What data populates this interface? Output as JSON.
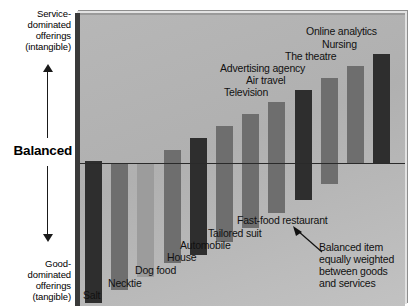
{
  "axis": {
    "top_label": "Service-\ndominated\nofferings\n(intangible)",
    "top_label_lines": [
      "Service-",
      "dominated",
      "offerings",
      "(intangible)"
    ],
    "center_label": "Balanced",
    "bottom_label_lines": [
      "Good-",
      "dominated",
      "offerings",
      "(tangible)"
    ],
    "up_arrow_icon": "arrow-up-icon",
    "down_arrow_icon": "arrow-down-icon"
  },
  "annotation": {
    "lines": [
      "Balanced item",
      "equally weighted",
      "between goods",
      "and services"
    ],
    "pointer_icon": "callout-arrow-icon"
  },
  "chart_data": {
    "type": "bar",
    "title": "",
    "subtitle": "",
    "xlabel": "",
    "ylabel": "Balanced",
    "grid": false,
    "legend": "none",
    "baseline": 0,
    "ylim": [
      -100,
      100
    ],
    "axis_top_text": "Service-dominated offerings (intangible)",
    "axis_bottom_text": "Good-dominated offerings (tangible)",
    "axis_center_text": "Balanced",
    "annotation_text": "Balanced item equally weighted between goods and services",
    "categories": [
      "Salt",
      "Necktie",
      "Dog food",
      "House",
      "Automobile",
      "Tailored suit",
      "Television",
      "Air travel",
      "Advertising agency",
      "The theatre",
      "Nursing",
      "Online analytics"
    ],
    "values": [
      -92,
      -82,
      -72,
      -56,
      -48,
      -34,
      -20,
      -8,
      0,
      12,
      30,
      46
    ],
    "series": [
      {
        "name": "Goods-services continuum",
        "values": [
          -92,
          -82,
          -72,
          -56,
          -48,
          -34,
          -20,
          -8,
          0,
          12,
          30,
          46
        ]
      }
    ],
    "bars": [
      {
        "label": "Salt",
        "top": -2,
        "bottom": 140,
        "shade": "dark"
      },
      {
        "label": "Necktie",
        "top": 0,
        "bottom": 127,
        "shade": "mid"
      },
      {
        "label": "Dog food",
        "top": 0,
        "bottom": 114,
        "shade": "light"
      },
      {
        "label": "House",
        "top": -13,
        "bottom": 100,
        "shade": "mid"
      },
      {
        "label": "Automobile",
        "top": -25,
        "bottom": 92,
        "shade": "dark"
      },
      {
        "label": "Tailored suit",
        "top": -37,
        "bottom": 79,
        "shade": "mid"
      },
      {
        "label": "Television",
        "top": -49,
        "bottom": 65,
        "shade": "mid"
      },
      {
        "label": "Air travel",
        "top": -61,
        "bottom": 50,
        "shade": "mid"
      },
      {
        "label": "Advertising agency",
        "top": -73,
        "bottom": 37,
        "shade": "dark"
      },
      {
        "label": "The theatre",
        "top": -85,
        "bottom": 21,
        "shade": "mid"
      },
      {
        "label": "Nursing",
        "top": -97,
        "bottom": 0,
        "shade": "mid"
      },
      {
        "label": "Online analytics",
        "top": -109,
        "bottom": 0,
        "shade": "dark"
      }
    ]
  },
  "labels": {
    "salt": "Salt",
    "necktie": "Necktie",
    "dog_food": "Dog food",
    "house": "House",
    "automobile": "Automobile",
    "tailored_suit": "Tailored suit",
    "fast_food": "Fast-food restaurant",
    "television": "Television",
    "air_travel": "Air travel",
    "advertising_agency": "Advertising agency",
    "the_theatre": "The theatre",
    "nursing": "Nursing",
    "online_analytics": "Online analytics"
  },
  "colors": {
    "panel_bg": "#b5b5b5",
    "bar_dark": "#2e2e2e",
    "bar_mid": "#6e6e6e",
    "bar_light": "#9c9c9c",
    "baseline": "#2a2a2a",
    "text": "#111111"
  }
}
